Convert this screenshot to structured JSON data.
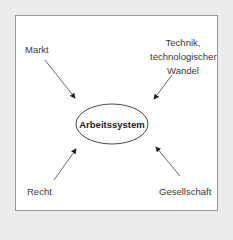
{
  "diagram": {
    "center": "Arbeitssystem",
    "influences": [
      {
        "id": "markt",
        "label": "Markt"
      },
      {
        "id": "technik",
        "lines": [
          "Technik,",
          "technologischer",
          "Wandel"
        ]
      },
      {
        "id": "recht",
        "label": "Recht"
      },
      {
        "id": "gesellschaft",
        "label": "Gesellschaft"
      }
    ]
  },
  "colors": {
    "background": "#ececec",
    "frame": "#ffffff",
    "border": "#9a9a9a",
    "line": "#333333"
  }
}
